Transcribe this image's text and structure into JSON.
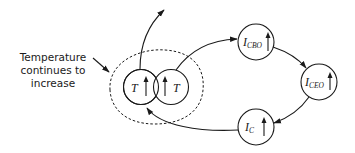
{
  "annotation": {
    "lines": [
      "Temperature",
      "continues to",
      "increase"
    ]
  },
  "nodes": {
    "t_left": {
      "label": "T",
      "indicator": "↑"
    },
    "t_right": {
      "label": "T",
      "indicator": "↑"
    },
    "icbo": {
      "label_main": "I",
      "label_sub": "CBO",
      "indicator": "↑"
    },
    "iceo": {
      "label_main": "I",
      "label_sub": "CEO",
      "indicator": "↑"
    },
    "ic": {
      "label_main": "I",
      "label_sub": "C",
      "indicator": "↑"
    }
  },
  "colors": {
    "ink": "#1a1a1a",
    "background": "#ffffff"
  }
}
